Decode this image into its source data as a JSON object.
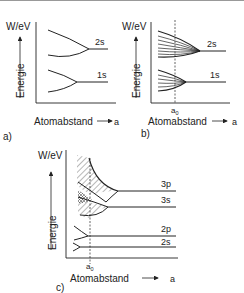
{
  "panels": [
    {
      "id": "a",
      "caption": "a)",
      "y_unit": "W/eV",
      "y_label": "Energie",
      "x_label": "Atomabstand",
      "x_symbol": "a",
      "levels": [
        "2s",
        "1s"
      ]
    },
    {
      "id": "b",
      "caption": "b)",
      "y_unit": "W/eV",
      "y_label": "Energie",
      "x_label": "Atomabstand",
      "x_symbol": "a",
      "marker": "a",
      "marker_sub": "0",
      "levels": [
        "2s",
        "1s"
      ]
    },
    {
      "id": "c",
      "caption": "c)",
      "y_unit": "W/eV",
      "y_label": "Energie",
      "x_label": "Atomabstand",
      "x_symbol": "a",
      "marker": "a",
      "marker_sub": "0",
      "levels": [
        "3p",
        "3s",
        "2p",
        "2s"
      ]
    }
  ]
}
